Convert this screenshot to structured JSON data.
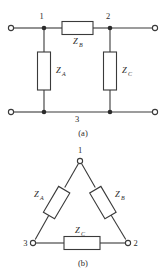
{
  "figure": {
    "background_color": "#ffffff",
    "line_color": "#3a3a3a",
    "text_color": "#2b2b2b"
  },
  "panel_a": {
    "caption": "(a)",
    "topology": "tee",
    "nodes": [
      {
        "id": "1",
        "label": "1"
      },
      {
        "id": "2",
        "label": "2"
      },
      {
        "id": "3",
        "label": "3"
      }
    ],
    "components": [
      {
        "id": "ZA",
        "symbol": "Z",
        "subscript": "A",
        "orientation": "vertical"
      },
      {
        "id": "ZB",
        "symbol": "Z",
        "subscript": "B",
        "orientation": "horizontal"
      },
      {
        "id": "ZC",
        "symbol": "Z",
        "subscript": "C",
        "orientation": "vertical"
      }
    ],
    "terminals": [
      {
        "id": "top-left",
        "position": "top-left"
      },
      {
        "id": "top-right",
        "position": "top-right"
      },
      {
        "id": "bottom-left",
        "position": "bottom-left"
      },
      {
        "id": "bottom-right",
        "position": "bottom-right"
      }
    ]
  },
  "panel_b": {
    "caption": "(b)",
    "topology": "delta",
    "nodes": [
      {
        "id": "1",
        "label": "1"
      },
      {
        "id": "2",
        "label": "2"
      },
      {
        "id": "3",
        "label": "3"
      }
    ],
    "components": [
      {
        "id": "ZA",
        "symbol": "Z",
        "subscript": "A",
        "orientation": "left-leg"
      },
      {
        "id": "ZB",
        "symbol": "Z",
        "subscript": "B",
        "orientation": "right-leg"
      },
      {
        "id": "ZC",
        "symbol": "Z",
        "subscript": "C",
        "orientation": "bottom"
      }
    ]
  }
}
